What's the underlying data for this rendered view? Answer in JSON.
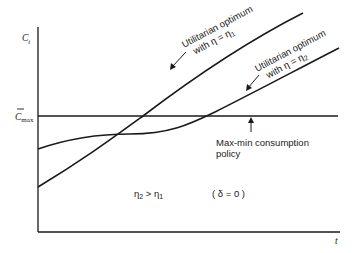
{
  "diagram": {
    "y_axis_label": "C",
    "y_axis_label_sub": "t",
    "x_axis_label": "t",
    "cmax_label": "C",
    "cmax_label_sub": "max",
    "curve1_label_line1": "Utilitarian optimum",
    "curve1_label_line2": "with  η = η",
    "curve1_label_sub": "1",
    "curve2_label_line1": "Utilitarian optimum",
    "curve2_label_line2": "with η = η",
    "curve2_label_sub": "2",
    "maxmin_label_line1": "Max-min consumption",
    "maxmin_label_line2": "policy",
    "condition_text": "η",
    "condition_sub_a": "2",
    "condition_mid": " > η",
    "condition_sub_b": "1",
    "delta_text": "( δ = 0 )",
    "line_color": "#1a1a1a"
  }
}
